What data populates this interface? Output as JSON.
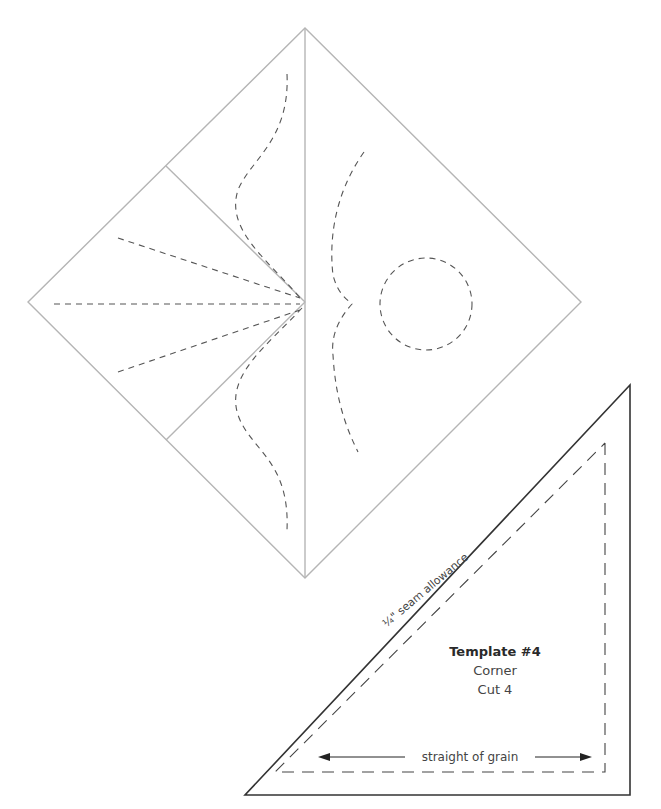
{
  "diagram": {
    "type": "quilt-pattern-template",
    "block": {
      "shape": "diamond",
      "description": "Quilt block with triangular patches and dashed quilting lines"
    },
    "template": {
      "title": "Template #4",
      "name": "Corner",
      "cut": "Cut 4",
      "seam_label": "¼\" seam allowance",
      "grain_label": "straight of grain"
    },
    "colors": {
      "outline": "#b5b5b5",
      "quilting": "#555555",
      "template_outline": "#333333",
      "text": "#2a2a2a"
    }
  }
}
